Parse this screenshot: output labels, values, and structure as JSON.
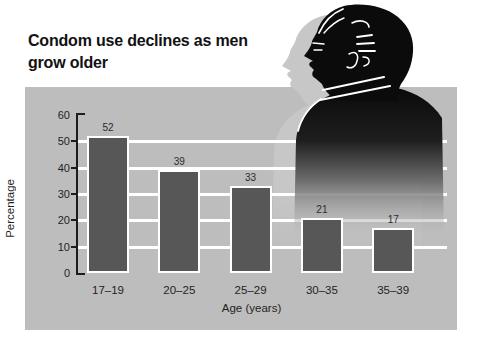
{
  "title": {
    "text": "Condom use declines as men grow older"
  },
  "chart_data": {
    "type": "bar",
    "title": "Condom use declines as men grow older",
    "categories": [
      "17–19",
      "20–25",
      "25–29",
      "30–35",
      "35–39"
    ],
    "values": [
      52,
      39,
      33,
      21,
      17
    ],
    "xlabel": "Age (years)",
    "ylabel": "Percentage",
    "ylim": [
      0,
      60
    ],
    "yticks": [
      0,
      10,
      20,
      30,
      40,
      50,
      60
    ],
    "gridlines_at": [
      10,
      20,
      30,
      40,
      50
    ],
    "legend": "none",
    "grid": "horizontal",
    "colors": {
      "bar_fill": "#575757",
      "bar_border": "#ffffff",
      "panel_bg": "#bdbdbd",
      "gridline": "#ffffff",
      "axis": "#1c1c1c",
      "text": "#1f1f1f",
      "background": "#ffffff",
      "silhouette": "#0b0b0b",
      "silhouette_shadow": "#c7c7c7"
    }
  },
  "illustration": {
    "icon": "man-profile-silhouette-icon"
  }
}
